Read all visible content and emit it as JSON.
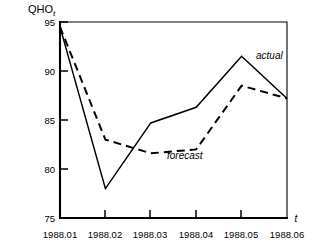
{
  "chart_data": {
    "type": "line",
    "title": "",
    "subtitle": "",
    "xlabel": "t",
    "ylabel": "QHO",
    "ylabel_subscript": "t",
    "grid": false,
    "legend_position": "inline-annotations",
    "categories": [
      "1988.01",
      "1988.02",
      "1988.03",
      "1988.04",
      "1988.05",
      "1988.06"
    ],
    "x": [
      1,
      2,
      3,
      4,
      5,
      6
    ],
    "xlim": [
      1,
      6
    ],
    "ylim": [
      75,
      95
    ],
    "yticks": [
      75,
      80,
      85,
      90,
      95
    ],
    "xticks": [
      "1988.01",
      "1988.02",
      "1988.03",
      "1988.04",
      "1988.05",
      "1988.06"
    ],
    "series": [
      {
        "name": "actual",
        "style": "solid",
        "color": "#000000",
        "values": [
          94.5,
          78.0,
          84.7,
          86.3,
          91.5,
          87.2
        ]
      },
      {
        "name": "forecast",
        "style": "dashed",
        "color": "#000000",
        "values": [
          94.5,
          83.0,
          81.6,
          82.0,
          88.5,
          87.2
        ]
      }
    ],
    "annotations": [
      {
        "text": "actual",
        "x": 5.0,
        "y": 92.6
      },
      {
        "text": "forecast",
        "x": 3.35,
        "y": 80.2
      }
    ]
  },
  "axis": {
    "y_tick_labels": [
      "95",
      "90",
      "85",
      "80",
      "75"
    ],
    "x_tick_labels": [
      "1988.01",
      "1988.02",
      "1988.03",
      "1988.04",
      "1988.05",
      "1988.06"
    ],
    "y_title_main": "QHO",
    "y_title_sub": "t",
    "x_title": "t"
  },
  "annotations": {
    "actual_label": "actual",
    "forecast_label": "forecast"
  }
}
